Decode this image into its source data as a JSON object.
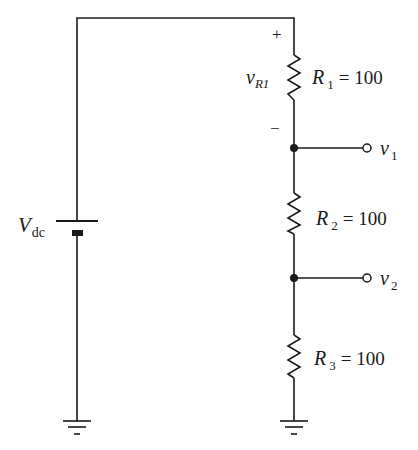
{
  "diagram": {
    "type": "circuit",
    "source": {
      "label_main": "V",
      "label_sub": "dc"
    },
    "resistors": [
      {
        "name": "R",
        "sub": "1",
        "eq": "= 100"
      },
      {
        "name": "R",
        "sub": "2",
        "eq": "= 100"
      },
      {
        "name": "R",
        "sub": "3",
        "eq": "= 100"
      }
    ],
    "voltage_drop": {
      "main": "v",
      "sub": "R1",
      "plus": "+",
      "minus": "−"
    },
    "outputs": [
      {
        "main": "v",
        "sub": "1"
      },
      {
        "main": "v",
        "sub": "2"
      }
    ]
  }
}
